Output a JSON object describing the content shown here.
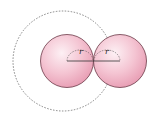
{
  "diagram": {
    "labels": {
      "left_radius": "r",
      "right_radius": "r"
    },
    "colors": {
      "sphere_fill": "#f2b8c8",
      "sphere_stroke": "#6b3a48",
      "dashed_circle": "#777777",
      "line": "#333333"
    }
  }
}
